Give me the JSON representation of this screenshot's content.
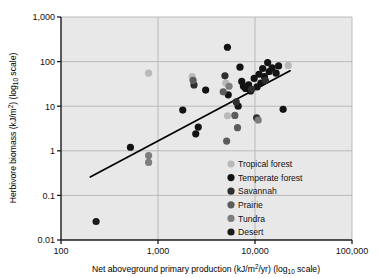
{
  "chart_data": {
    "type": "scatter",
    "title": "",
    "xlabel": "Net aboveground primary production (kJ/m2/yr) (log10 scale)",
    "ylabel": "Herbivore biomass (kJ/m2) (log10 scale)",
    "xscale": "log",
    "yscale": "log",
    "xlim": [
      100,
      100000
    ],
    "ylim": [
      0.01,
      1000
    ],
    "grid": true,
    "xticks": [
      100,
      1000,
      10000,
      100000
    ],
    "xtick_labels": [
      "100",
      "1,000",
      "10,000",
      "100,000"
    ],
    "yticks": [
      0.01,
      0.1,
      1,
      10,
      100,
      1000
    ],
    "ytick_labels": [
      "0.01",
      "0.1",
      "1",
      "10",
      "100",
      "1,000"
    ],
    "legend_position": "inside-lower-right",
    "series": [
      {
        "name": "Tropical forest",
        "color": "#b9b9b9",
        "points": [
          [
            800,
            55
          ],
          [
            2250,
            46
          ],
          [
            5000,
            33
          ],
          [
            5200,
            6.1
          ],
          [
            22000,
            82
          ]
        ]
      },
      {
        "name": "Temperate forest",
        "color": "#131313",
        "points": [
          [
            520,
            1.2
          ],
          [
            1800,
            8.2
          ],
          [
            2450,
            2.4
          ],
          [
            2600,
            3.4
          ],
          [
            3100,
            23
          ],
          [
            5200,
            210
          ],
          [
            5300,
            18
          ],
          [
            6700,
            10
          ],
          [
            7000,
            75
          ],
          [
            7300,
            36
          ],
          [
            7600,
            28
          ],
          [
            8000,
            25
          ],
          [
            8600,
            30
          ],
          [
            9000,
            22
          ],
          [
            9800,
            42
          ],
          [
            10500,
            27
          ],
          [
            11000,
            52
          ],
          [
            11500,
            33
          ],
          [
            12000,
            70
          ],
          [
            12500,
            46
          ],
          [
            13500,
            95
          ],
          [
            14000,
            60
          ],
          [
            15000,
            72
          ],
          [
            16500,
            55
          ],
          [
            17500,
            80
          ],
          [
            19500,
            8.5
          ]
        ]
      },
      {
        "name": "Savannah",
        "color": "#2e2e2e",
        "points": [
          [
            2350,
            30
          ],
          [
            4900,
            48
          ],
          [
            6400,
            12.5
          ],
          [
            9200,
            24
          ],
          [
            10400,
            5.5
          ],
          [
            12800,
            38
          ]
        ]
      },
      {
        "name": "Prairie",
        "color": "#5c5c5c",
        "points": [
          [
            2300,
            38
          ],
          [
            4700,
            21
          ],
          [
            6200,
            6.2
          ],
          [
            6600,
            3.3
          ],
          [
            5100,
            1.65
          ]
        ]
      },
      {
        "name": "Tundra",
        "color": "#7d7d7d",
        "points": [
          [
            800,
            0.78
          ],
          [
            800,
            0.55
          ],
          [
            5400,
            28
          ],
          [
            10800,
            4.9
          ]
        ]
      },
      {
        "name": "Desert",
        "color": "#1a1a1a",
        "points": [
          [
            230,
            0.026
          ]
        ]
      }
    ],
    "trendline": {
      "x": [
        200,
        23000
      ],
      "y": [
        0.26,
        62
      ],
      "color": "#000000"
    }
  },
  "axes": {
    "y_title_main": "Herbivore biomass (kJ/m",
    "y_title_sup": "2",
    "y_title_tail": ") (log",
    "y_title_sub": "10",
    "y_title_end": " scale)",
    "x_title_main": "Net aboveground primary production (kJ/m",
    "x_title_sup": "2",
    "x_title_tail": "/yr) (log",
    "x_title_sub": "10",
    "x_title_end": " scale)"
  },
  "legend": {
    "items": [
      {
        "label": "Tropical forest",
        "color": "#b9b9b9"
      },
      {
        "label": "Temperate forest",
        "color": "#131313"
      },
      {
        "label": "Savannah",
        "color": "#2e2e2e"
      },
      {
        "label": "Prairie",
        "color": "#5c5c5c"
      },
      {
        "label": "Tundra",
        "color": "#7d7d7d"
      },
      {
        "label": "Desert",
        "color": "#1a1a1a"
      }
    ]
  },
  "style": {
    "plot_background": "#e8e8e8",
    "grid_color": "#b4b4b4",
    "axis_color": "#1a1a1a",
    "page_background": "#ffffff"
  }
}
